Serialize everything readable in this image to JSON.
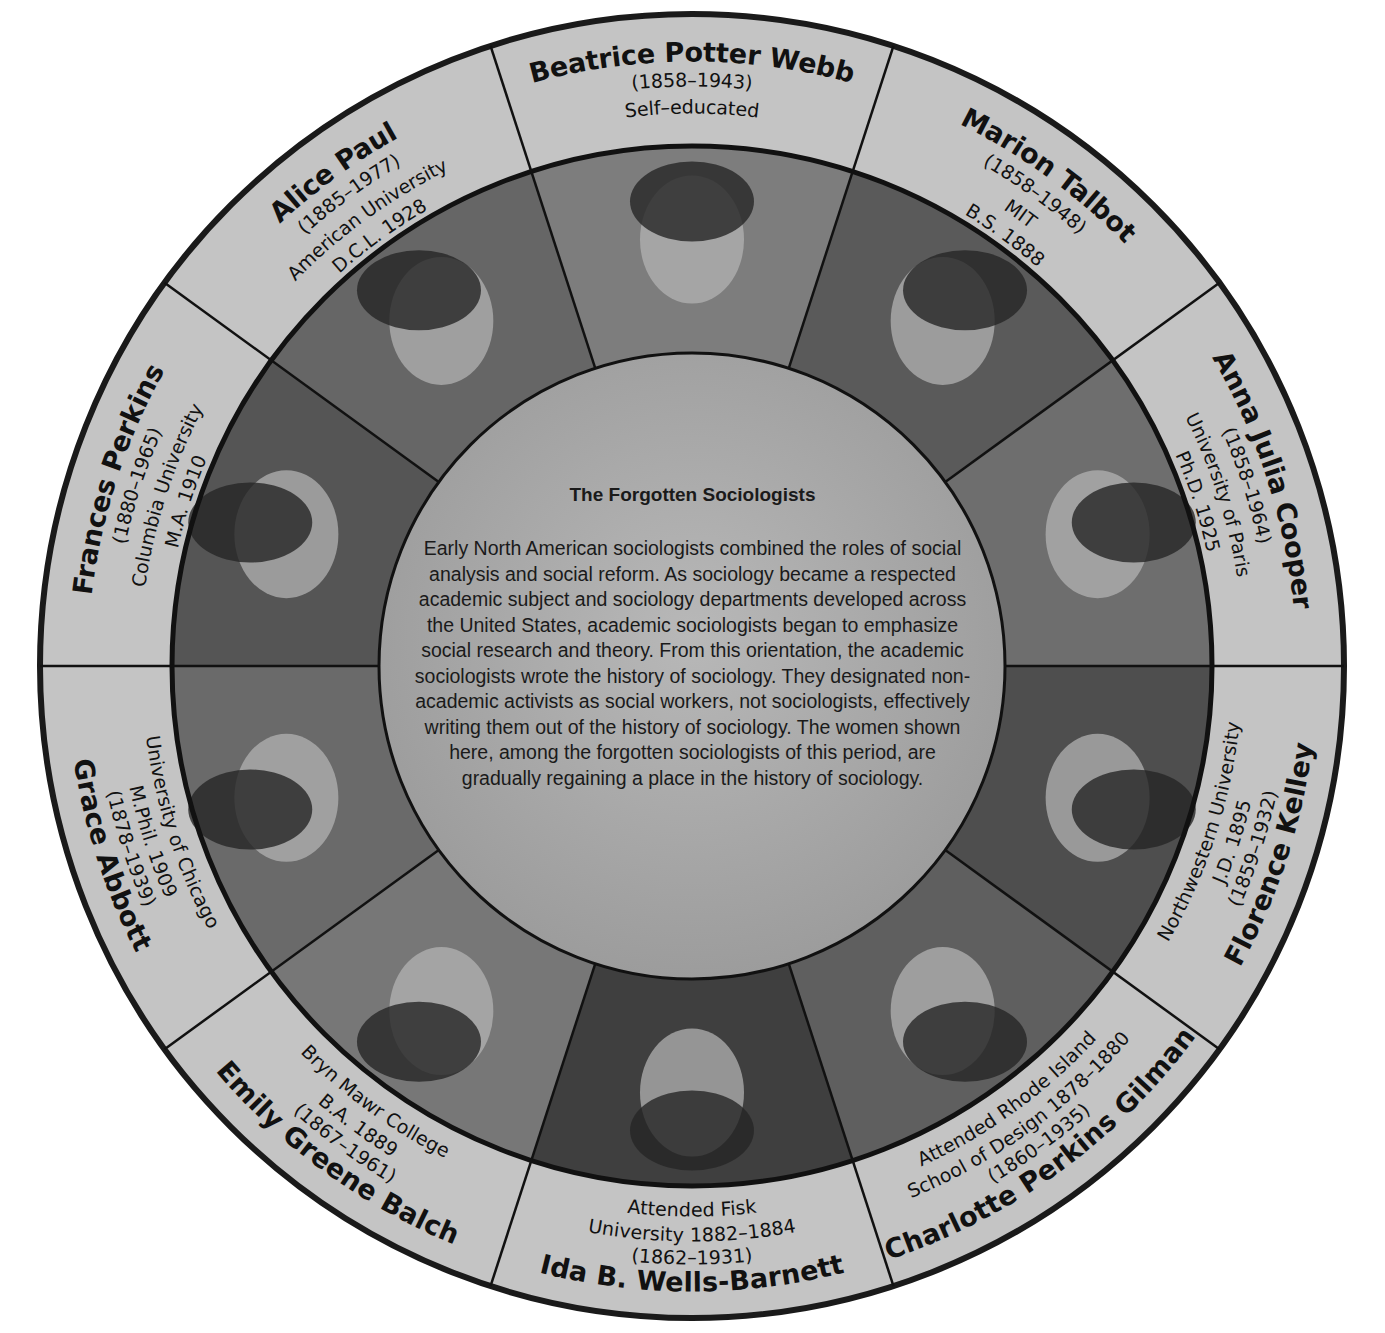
{
  "title": "The Forgotten Sociologists",
  "body": "Early North American sociologists combined the roles of social analysis and social reform. As sociology became a respected academic subject and sociology departments developed across the United States, academic sociologists began to emphasize social research and theory. From this orientation, the academic sociologists wrote the history of sociology. They designated non-academic activists as social workers, not sociologists, effectively writing them out of the history of sociology. The women shown here, among the forgotten sociologists of this period, are gradually regaining a place in the history of sociology.",
  "colors": {
    "ring_fill": "#c4c4c4",
    "center_fill": "#a9a9a9",
    "stroke": "#1a1a1a",
    "photo_light": "#8e8e8e",
    "photo_dark": "#3a3a3a"
  },
  "sociologists": [
    {
      "name": "Beatrice Potter Webb",
      "years": "(1858–1943)",
      "education": [
        "Self–educated"
      ]
    },
    {
      "name": "Marion Talbot",
      "years": "(1858–1948)",
      "education": [
        "MIT",
        "B.S. 1888"
      ]
    },
    {
      "name": "Anna Julia Cooper",
      "years": "(1858–1964)",
      "education": [
        "University of Paris",
        "Ph.D. 1925"
      ]
    },
    {
      "name": "Florence Kelley",
      "years": "(1859–1932)",
      "education": [
        "Northwestern University",
        "J.D. 1895"
      ]
    },
    {
      "name": "Charlotte Perkins Gilman",
      "years": "(1860–1935)",
      "education": [
        "Attended Rhode Island",
        "School of Design 1878–1880"
      ]
    },
    {
      "name": "Ida B. Wells-Barnett",
      "years": "(1862–1931)",
      "education": [
        "Attended Fisk",
        "University 1882–1884"
      ]
    },
    {
      "name": "Emily Greene Balch",
      "years": "(1867–1961)",
      "education": [
        "Bryn Mawr College",
        "B.A. 1889"
      ]
    },
    {
      "name": "Grace Abbott",
      "years": "(1878–1939)",
      "education": [
        "University of Chicago",
        "M.Phil. 1909"
      ]
    },
    {
      "name": "Frances Perkins",
      "years": "(1880–1965)",
      "education": [
        "Columbia University",
        "M.A. 1910"
      ]
    },
    {
      "name": "Alice Paul",
      "years": "(1885–1977)",
      "education": [
        "American University",
        "D.C.L. 1928"
      ]
    }
  ]
}
